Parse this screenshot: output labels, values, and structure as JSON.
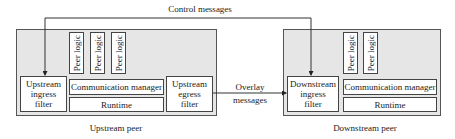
{
  "diagram": {
    "control_label": "Control messages",
    "overlay_label_line1": "Overlay",
    "overlay_label_line2": "messages",
    "upstream_peer": {
      "caption": "Upstream peer",
      "ingress_filter": [
        "Upstream",
        "ingress",
        "filter"
      ],
      "egress_filter": [
        "Upstream",
        "egress",
        "filter"
      ],
      "peer_logic": [
        "Peer logic",
        "Peer logic",
        "Peer logic"
      ],
      "communication_manager": "Communication manager",
      "runtime": "Runtime"
    },
    "downstream_peer": {
      "caption": "Downstream peer",
      "ingress_filter": [
        "Downstream",
        "ingress",
        "filter"
      ],
      "peer_logic": [
        "Peer logic",
        "Peer logic"
      ],
      "communication_manager": "Communication manager",
      "runtime": "Runtime"
    },
    "colors": {
      "peer_fill": "#e6e6e6",
      "box_fill": "#ffffff",
      "stroke": "#444444"
    }
  }
}
